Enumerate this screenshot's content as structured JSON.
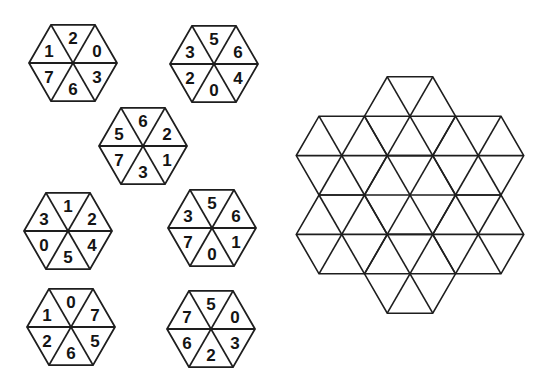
{
  "colors": {
    "background": "#ffffff",
    "line": "#1e1e1e",
    "digit": "#141414"
  },
  "pieces": [
    {
      "id": "piece-1",
      "center": {
        "x": 73,
        "y": 63
      },
      "digits": {
        "top": "2",
        "upper_left": "1",
        "upper_right": "0",
        "lower_left": "7",
        "lower_right": "3",
        "bottom": "6"
      }
    },
    {
      "id": "piece-2",
      "center": {
        "x": 214,
        "y": 64
      },
      "digits": {
        "top": "5",
        "upper_left": "3",
        "upper_right": "6",
        "lower_left": "2",
        "lower_right": "4",
        "bottom": "0"
      }
    },
    {
      "id": "piece-3",
      "center": {
        "x": 143,
        "y": 146
      },
      "digits": {
        "top": "6",
        "upper_left": "5",
        "upper_right": "2",
        "lower_left": "7",
        "lower_right": "1",
        "bottom": "3"
      }
    },
    {
      "id": "piece-4",
      "center": {
        "x": 68,
        "y": 231
      },
      "digits": {
        "top": "1",
        "upper_left": "3",
        "upper_right": "2",
        "lower_left": "0",
        "lower_right": "4",
        "bottom": "5"
      }
    },
    {
      "id": "piece-5",
      "center": {
        "x": 212,
        "y": 228
      },
      "digits": {
        "top": "5",
        "upper_left": "3",
        "upper_right": "6",
        "lower_left": "7",
        "lower_right": "1",
        "bottom": "0"
      }
    },
    {
      "id": "piece-6",
      "center": {
        "x": 71,
        "y": 327
      },
      "digits": {
        "top": "0",
        "upper_left": "1",
        "upper_right": "7",
        "lower_left": "2",
        "lower_right": "5",
        "bottom": "6"
      }
    },
    {
      "id": "piece-7",
      "center": {
        "x": 211,
        "y": 329
      },
      "digits": {
        "top": "5",
        "upper_left": "7",
        "upper_right": "0",
        "lower_left": "6",
        "lower_right": "3",
        "bottom": "2"
      }
    }
  ],
  "piece_side": 44,
  "grid": {
    "center": {
      "x": 410,
      "y": 195
    },
    "side": 45.5,
    "cells": [
      "center",
      "north",
      "north_east",
      "south_east",
      "south",
      "south_west",
      "north_west"
    ],
    "triangle_count": 42,
    "empty": true
  }
}
